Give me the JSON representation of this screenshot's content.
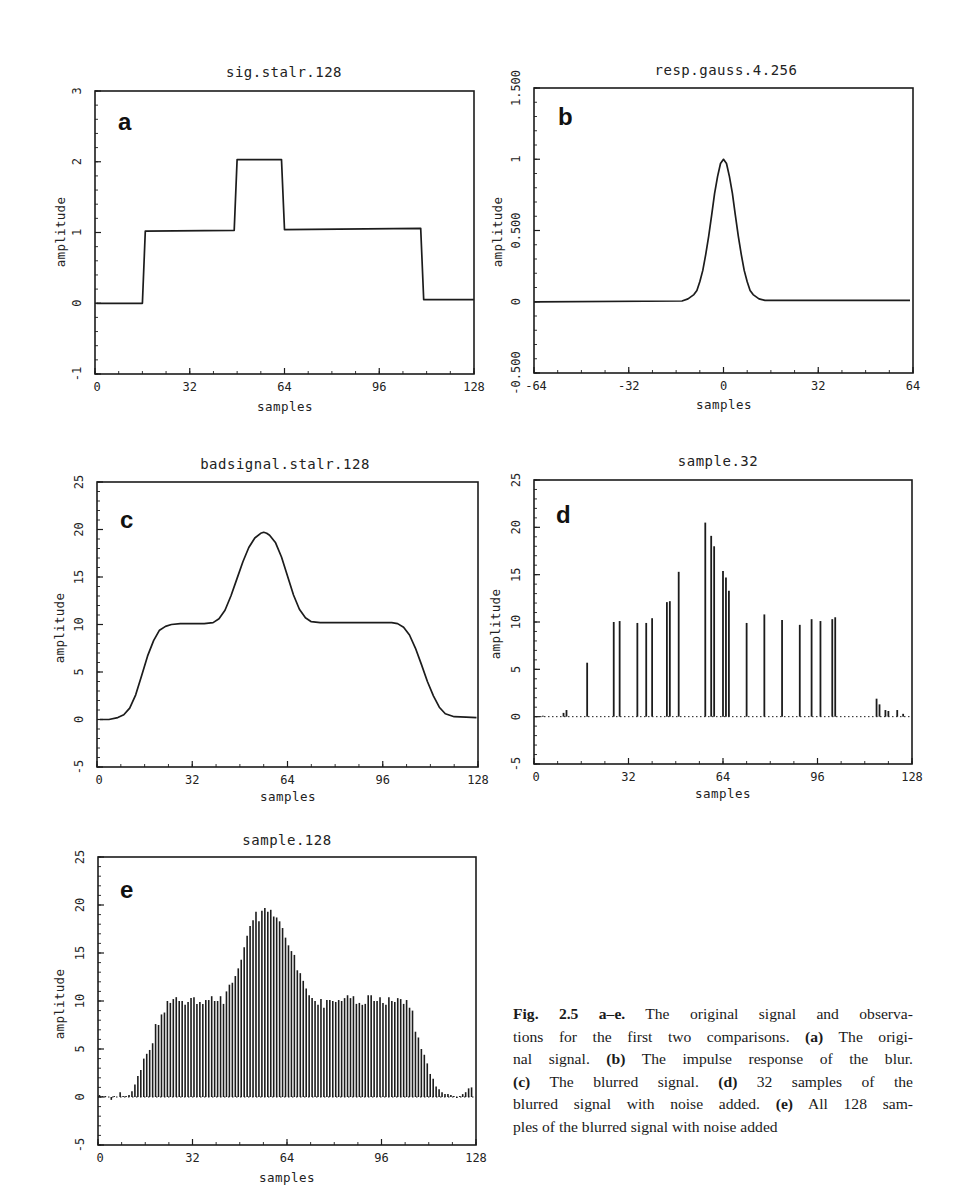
{
  "figure": {
    "caption": {
      "label": "Fig. 2.5 a–e.",
      "lines": [
        [
          {
            "t": "Fig. 2.5 a–e.",
            "b": true
          },
          {
            "t": " The original signal and observa-",
            "b": false
          }
        ],
        [
          {
            "t": "tions for the first two comparisons. ",
            "b": false
          },
          {
            "t": "(a)",
            "b": true
          },
          {
            "t": " The origi-",
            "b": false
          }
        ],
        [
          {
            "t": "nal signal. ",
            "b": false
          },
          {
            "t": "(b)",
            "b": true
          },
          {
            "t": " The impulse response of the blur.",
            "b": false
          }
        ],
        [
          {
            "t": "(c)",
            "b": true
          },
          {
            "t": " The blurred signal. ",
            "b": false
          },
          {
            "t": "(d)",
            "b": true
          },
          {
            "t": " 32 samples of the",
            "b": false
          }
        ],
        [
          {
            "t": "blurred signal with noise added. ",
            "b": false
          },
          {
            "t": "(e)",
            "b": true
          },
          {
            "t": " All 128 sam-",
            "b": false
          }
        ],
        [
          {
            "t": "ples of the blurred signal with noise added",
            "b": false
          }
        ]
      ]
    }
  },
  "chart_data": [
    {
      "id": "a",
      "type": "line",
      "panel_letter": "a",
      "title": "sig.stalr.128",
      "xlabel": "samples",
      "ylabel": "amplitude",
      "xlim": [
        0,
        128
      ],
      "ylim": [
        -1,
        3
      ],
      "xticks": [
        0,
        32,
        64,
        96,
        128
      ],
      "xtick_labels": [
        "0",
        "32",
        "64",
        "96",
        "128"
      ],
      "yticks": [
        -1,
        0,
        1,
        2,
        3
      ],
      "ytick_labels": [
        "-1",
        "0",
        "1",
        "2",
        "3"
      ],
      "minor_x_step": 8,
      "minor_y_step": 0.2,
      "grid": false,
      "x": [
        0.5,
        16,
        17,
        47,
        48,
        63,
        64,
        110,
        111,
        128
      ],
      "y": [
        0,
        0,
        1.02,
        1.03,
        2.03,
        2.03,
        1.04,
        1.06,
        0.05,
        0.05
      ]
    },
    {
      "id": "b",
      "type": "line",
      "panel_letter": "b",
      "title": "resp.gauss.4.256",
      "xlabel": "samples",
      "ylabel": "amplitude",
      "xlim": [
        -64,
        64
      ],
      "ylim": [
        -0.5,
        1.5
      ],
      "xticks": [
        -64,
        -32,
        0,
        32,
        64
      ],
      "xtick_labels": [
        "-64",
        "-32",
        "0",
        "32",
        "64"
      ],
      "yticks": [
        -0.5,
        0,
        0.5,
        1,
        1.5
      ],
      "ytick_labels": [
        "-0.500",
        "0",
        "0.500",
        "1",
        "1.500"
      ],
      "minor_x_step": 8,
      "minor_y_step": 0.1,
      "grid": false,
      "x": [
        -64,
        -14,
        -12,
        -10,
        -9,
        -8,
        -7,
        -6,
        -5,
        -4,
        -3,
        -2,
        -1,
        0,
        1,
        2,
        3,
        4,
        5,
        6,
        7,
        8,
        9,
        10,
        12,
        14,
        63
      ],
      "y": [
        0,
        0.005,
        0.02,
        0.05,
        0.08,
        0.14,
        0.22,
        0.33,
        0.46,
        0.61,
        0.76,
        0.88,
        0.97,
        1.0,
        0.97,
        0.88,
        0.76,
        0.61,
        0.46,
        0.33,
        0.22,
        0.14,
        0.08,
        0.05,
        0.02,
        0.01,
        0.01
      ]
    },
    {
      "id": "c",
      "type": "line",
      "panel_letter": "c",
      "title": "badsignal.stalr.128",
      "xlabel": "samples",
      "ylabel": "amplitude",
      "xlim": [
        0,
        128
      ],
      "ylim": [
        -5,
        25
      ],
      "xticks": [
        0,
        32,
        64,
        96,
        128
      ],
      "xtick_labels": [
        "0",
        "32",
        "64",
        "96",
        "128"
      ],
      "yticks": [
        -5,
        0,
        5,
        10,
        15,
        20,
        25
      ],
      "ytick_labels": [
        "-5",
        "0",
        "5",
        "10",
        "15",
        "20",
        "25"
      ],
      "minor_x_step": 8,
      "minor_y_step": 1,
      "grid": false,
      "x": [
        1,
        4,
        7,
        9,
        11,
        13,
        15,
        17,
        19,
        21,
        23,
        25,
        28,
        32,
        36,
        39,
        41,
        43,
        45,
        47,
        49,
        51,
        53,
        55,
        56,
        57,
        58,
        60,
        62,
        64,
        66,
        68,
        70,
        72,
        75,
        80,
        90,
        99,
        101,
        103,
        105,
        107,
        109,
        111,
        113,
        115,
        117,
        120,
        124,
        127.5
      ],
      "y": [
        0,
        0,
        0.2,
        0.5,
        1.2,
        2.6,
        4.6,
        6.7,
        8.3,
        9.4,
        9.8,
        10.0,
        10.1,
        10.1,
        10.1,
        10.2,
        10.6,
        11.5,
        13.0,
        14.8,
        16.6,
        18.1,
        19.1,
        19.6,
        19.7,
        19.6,
        19.4,
        18.6,
        17.1,
        15.1,
        13.1,
        11.6,
        10.7,
        10.3,
        10.2,
        10.2,
        10.2,
        10.2,
        10.1,
        9.7,
        8.9,
        7.5,
        5.8,
        4.0,
        2.5,
        1.3,
        0.6,
        0.3,
        0.25,
        0.2
      ]
    },
    {
      "id": "d",
      "type": "stem",
      "panel_letter": "d",
      "title": "sample.32",
      "xlabel": "samples",
      "ylabel": "amplitude",
      "xlim": [
        0,
        128
      ],
      "ylim": [
        -5,
        25
      ],
      "xticks": [
        0,
        32,
        64,
        96,
        128
      ],
      "xtick_labels": [
        "0",
        "32",
        "64",
        "96",
        "128"
      ],
      "yticks": [
        -5,
        0,
        5,
        10,
        15,
        20,
        25
      ],
      "ytick_labels": [
        "-5",
        "0",
        "5",
        "10",
        "15",
        "20",
        "25"
      ],
      "minor_x_step": 8,
      "minor_y_step": 1,
      "grid": false,
      "baseline": "dotted",
      "x": [
        3,
        10,
        11,
        18,
        27,
        29,
        35,
        38,
        40,
        45,
        46,
        49,
        58,
        60,
        61,
        64,
        65,
        66,
        72,
        78,
        84,
        90,
        94,
        97,
        101,
        102,
        116,
        117,
        119,
        120,
        123,
        125
      ],
      "y": [
        0.1,
        0.4,
        0.7,
        5.7,
        10.0,
        10.1,
        9.9,
        9.9,
        10.4,
        12.1,
        12.2,
        15.3,
        20.5,
        19.1,
        18.0,
        15.4,
        14.7,
        13.3,
        9.9,
        10.8,
        10.2,
        9.7,
        10.3,
        10.1,
        10.3,
        10.5,
        1.9,
        1.3,
        0.7,
        0.6,
        0.7,
        0.3
      ]
    },
    {
      "id": "e",
      "type": "stem",
      "panel_letter": "e",
      "title": "sample.128",
      "xlabel": "samples",
      "ylabel": "amplitude",
      "xlim": [
        0,
        128
      ],
      "ylim": [
        -5,
        25
      ],
      "xticks": [
        0,
        32,
        64,
        96,
        128
      ],
      "xtick_labels": [
        "0",
        "32",
        "64",
        "96",
        "128"
      ],
      "yticks": [
        -5,
        0,
        5,
        10,
        15,
        20,
        25
      ],
      "ytick_labels": [
        "-5",
        "0",
        "5",
        "10",
        "15",
        "20",
        "25"
      ],
      "minor_x_step": 8,
      "minor_y_step": 1,
      "grid": false,
      "baseline": "dotted",
      "x_start": 0,
      "x_step": 1,
      "y": [
        0.2,
        0.1,
        0.1,
        0.0,
        -0.3,
        0.1,
        0.0,
        0.5,
        0.1,
        0.1,
        0.2,
        0.6,
        1.3,
        2.2,
        2.8,
        4.0,
        4.5,
        4.9,
        5.6,
        7.6,
        7.5,
        8.6,
        8.8,
        10.0,
        9.8,
        10.2,
        10.4,
        10.0,
        10.0,
        9.6,
        9.9,
        10.3,
        10.4,
        9.7,
        9.9,
        9.7,
        10.1,
        10.1,
        10.5,
        10.0,
        10.0,
        10.5,
        9.7,
        11.0,
        11.7,
        11.9,
        12.6,
        13.4,
        14.3,
        15.6,
        16.8,
        17.8,
        18.4,
        19.3,
        18.3,
        19.4,
        19.7,
        19.3,
        19.5,
        18.8,
        18.7,
        18.3,
        17.6,
        16.6,
        15.8,
        15.2,
        14.8,
        13.2,
        12.9,
        12.1,
        11.3,
        10.6,
        10.3,
        10.0,
        9.6,
        10.2,
        9.3,
        10.1,
        10.1,
        10.0,
        9.9,
        10.1,
        10.0,
        10.3,
        10.6,
        10.3,
        10.5,
        9.7,
        9.8,
        9.6,
        9.7,
        10.6,
        10.6,
        10.0,
        10.0,
        10.4,
        9.8,
        9.6,
        10.4,
        10.0,
        9.9,
        10.3,
        10.2,
        9.7,
        10.1,
        9.3,
        9.0,
        6.8,
        6.2,
        5.0,
        4.4,
        3.5,
        2.4,
        1.9,
        1.1,
        0.8,
        0.5,
        0.3,
        0.3,
        0.2,
        0.1,
        -0.1,
        0.1,
        0.3,
        0.5,
        0.9,
        1.0,
        0.0
      ]
    }
  ]
}
